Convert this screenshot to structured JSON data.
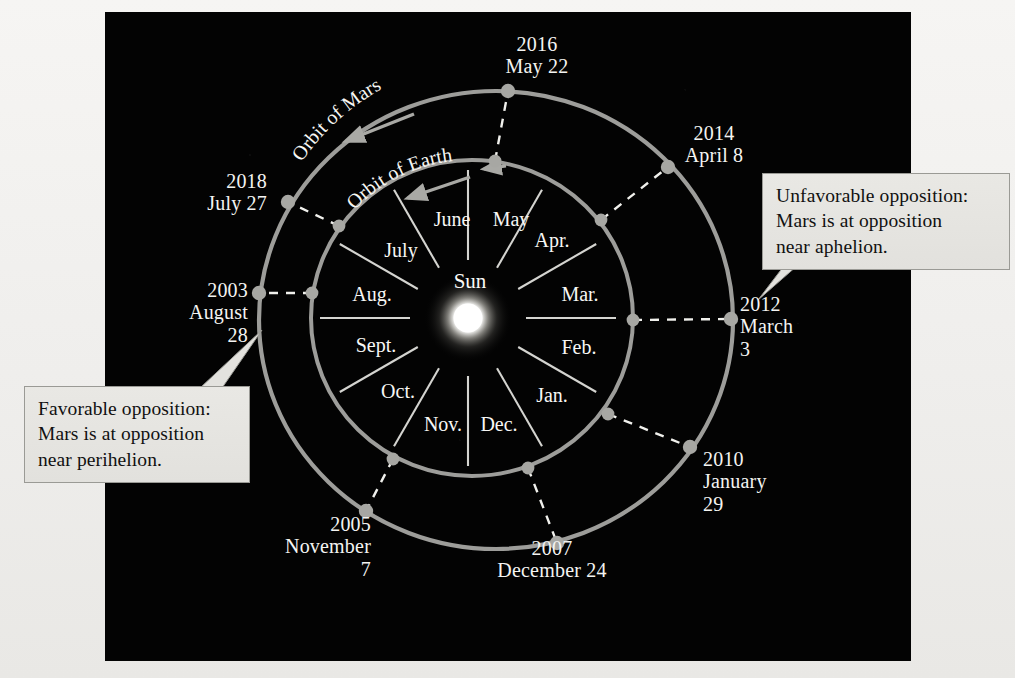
{
  "figure": {
    "sun_label": "Sun",
    "orbit_labels": {
      "mars": "Orbit of Mars",
      "earth": "Orbit of Earth"
    },
    "colors": {
      "background_paper": "#f2f1ef",
      "panel": "#030303",
      "orbit_line": "#9d9d9a",
      "planet_dot": "#a7a7a3",
      "opposition_line": "#f0f0ec",
      "month_divider": "#e8e8e4",
      "sun": "#ffffff",
      "callout_fill": "#e6e5e1",
      "callout_border": "#9a9a95",
      "label_text": "#f4f4f2"
    }
  },
  "months": [
    {
      "label": "May",
      "x": 511,
      "y": 219
    },
    {
      "label": "June",
      "x": 452,
      "y": 219
    },
    {
      "label": "July",
      "x": 401,
      "y": 250
    },
    {
      "label": "Aug.",
      "x": 372,
      "y": 294
    },
    {
      "label": "Sept.",
      "x": 376,
      "y": 345
    },
    {
      "label": "Oct.",
      "x": 398,
      "y": 391
    },
    {
      "label": "Nov.",
      "x": 443,
      "y": 424
    },
    {
      "label": "Dec.",
      "x": 499,
      "y": 424
    },
    {
      "label": "Jan.",
      "x": 552,
      "y": 395
    },
    {
      "label": "Feb.",
      "x": 579,
      "y": 347
    },
    {
      "label": "Mar.",
      "x": 580,
      "y": 294
    },
    {
      "label": "Apr.",
      "x": 552,
      "y": 240
    }
  ],
  "oppositions": [
    {
      "id": "2016",
      "year": "2016",
      "date_lines": [
        "2016",
        "May 22"
      ],
      "align": "center",
      "label_x": 537,
      "label_y": 33,
      "mars_dot": {
        "x": 508,
        "y": 91
      },
      "earth_dot": {
        "x": 495,
        "y": 161
      }
    },
    {
      "id": "2014",
      "year": "2014",
      "date_lines": [
        "2014",
        "April 8"
      ],
      "align": "center",
      "label_x": 714,
      "label_y": 122,
      "mars_dot": {
        "x": 668,
        "y": 167
      },
      "earth_dot": {
        "x": 601,
        "y": 220
      }
    },
    {
      "id": "2012",
      "year": "2012",
      "date_lines": [
        "2012",
        "March",
        "3"
      ],
      "align": "left",
      "label_x": 740,
      "label_y": 293,
      "mars_dot": {
        "x": 731,
        "y": 319
      },
      "earth_dot": {
        "x": 633,
        "y": 320
      }
    },
    {
      "id": "2010",
      "year": "2010",
      "date_lines": [
        "2010",
        "January",
        "29"
      ],
      "align": "left",
      "label_x": 703,
      "label_y": 448,
      "mars_dot": {
        "x": 690,
        "y": 447
      },
      "earth_dot": {
        "x": 608,
        "y": 414
      }
    },
    {
      "id": "2007",
      "year": "2007",
      "date_lines": [
        "2007",
        "December 24"
      ],
      "align": "center",
      "label_x": 552,
      "label_y": 537,
      "mars_dot": {
        "x": 557,
        "y": 543
      },
      "earth_dot": {
        "x": 528,
        "y": 468
      }
    },
    {
      "id": "2005",
      "year": "2005",
      "date_lines": [
        "2005",
        "November",
        "7"
      ],
      "align": "right",
      "label_x": 371,
      "label_y": 513,
      "mars_dot": {
        "x": 366,
        "y": 511
      },
      "earth_dot": {
        "x": 393,
        "y": 459
      }
    },
    {
      "id": "2003",
      "year": "2003",
      "date_lines": [
        "2003",
        "August",
        "28"
      ],
      "align": "right",
      "label_x": 248,
      "label_y": 279,
      "mars_dot": {
        "x": 259,
        "y": 293
      },
      "earth_dot": {
        "x": 312,
        "y": 293
      }
    },
    {
      "id": "2018",
      "year": "2018",
      "date_lines": [
        "2018",
        "July 27"
      ],
      "align": "right",
      "label_x": 267,
      "label_y": 170,
      "mars_dot": {
        "x": 288,
        "y": 202
      },
      "earth_dot": {
        "x": 339,
        "y": 226
      }
    }
  ],
  "callouts": {
    "favorable": {
      "lines": [
        "Favorable opposition:",
        "Mars is at opposition",
        "near perihelion."
      ]
    },
    "unfavorable": {
      "lines": [
        "Unfavorable opposition:",
        "Mars is at opposition",
        "near aphelion."
      ]
    }
  },
  "chart_data": {
    "type": "scatter",
    "xlabel": "",
    "ylabel": "",
    "categories": [
      "2003",
      "2005",
      "2007",
      "2010",
      "2012",
      "2014",
      "2016",
      "2018"
    ],
    "series": [
      {
        "name": "Opposition date",
        "values": [
          "August 28",
          "November 7",
          "December 24",
          "January 29",
          "March 3",
          "April 8",
          "May 22",
          "July 27"
        ]
      }
    ],
    "annotations": [
      "Favorable opposition: Mars is at opposition near perihelion.",
      "Unfavorable opposition: Mars is at opposition near aphelion."
    ],
    "legend": [
      "Orbit of Mars",
      "Orbit of Earth"
    ],
    "grid": false
  }
}
